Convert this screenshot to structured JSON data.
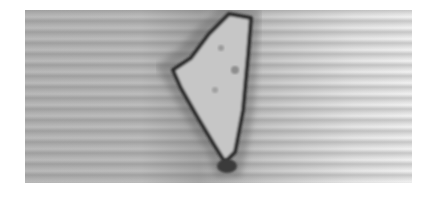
{
  "image": {
    "description": "Grayscale micrograph of a triangular cell on a horizontally striated background",
    "colors": {
      "background_left": "#b9b9b9",
      "background_right": "#f1f1f1",
      "cell_outline": "#2a2a2a",
      "cell_fill": "#c4c4c4"
    }
  }
}
